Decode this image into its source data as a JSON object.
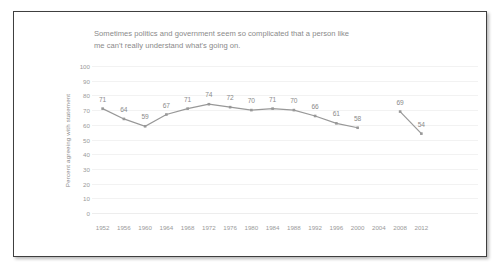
{
  "figure": {
    "border_color": "#3f3f3f",
    "background": "#ffffff"
  },
  "chart_data": {
    "type": "line",
    "title": "Sometimes politics and government seem so complicated that a person like me can't really understand what's going on.",
    "title_lines": [
      "Sometimes politics and government seem so complicated that a person like",
      "me can't really understand what's going on."
    ],
    "xlabel": "",
    "ylabel": "Percent agreeing with statement",
    "categories": [
      "1952",
      "1956",
      "1960",
      "1964",
      "1968",
      "1972",
      "1976",
      "1980",
      "1984",
      "1988",
      "1992",
      "1996",
      "2000",
      "2004",
      "2008",
      "2012"
    ],
    "values": [
      71,
      64,
      59,
      67,
      71,
      74,
      72,
      70,
      71,
      70,
      66,
      61,
      58,
      null,
      69,
      54
    ],
    "point_labels": [
      "71",
      "64",
      "59",
      "67",
      "71",
      "74",
      "72",
      "70",
      "71",
      "70",
      "66",
      "61",
      "58",
      "",
      "69",
      "54"
    ],
    "ylim": [
      0,
      100
    ],
    "y_ticks": [
      0,
      10,
      20,
      30,
      40,
      50,
      60,
      70,
      80,
      90,
      100
    ],
    "y_tick_labels": [
      "0",
      "10",
      "20",
      "30",
      "40",
      "50",
      "60",
      "70",
      "80",
      "90",
      "100"
    ],
    "grid": true,
    "legend": false,
    "series_color": "#989898",
    "marker": "square",
    "gaps_at": [
      "2004"
    ],
    "segments": [
      {
        "start_index": 0,
        "end_index": 12
      },
      {
        "start_index": 14,
        "end_index": 15
      }
    ]
  }
}
